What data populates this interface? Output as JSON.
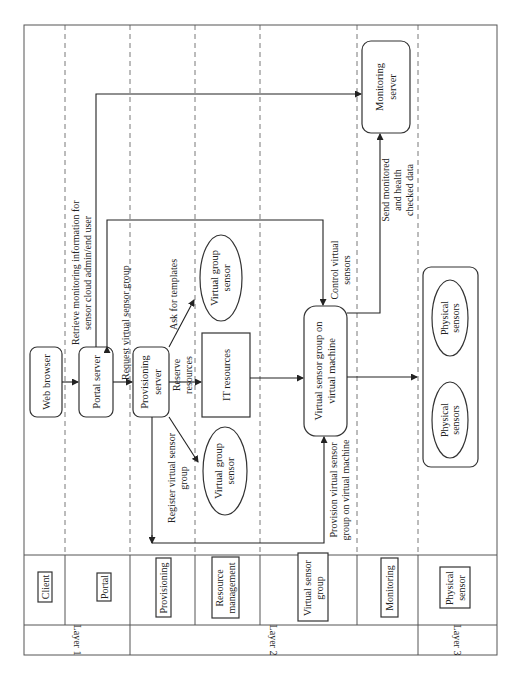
{
  "diagram": {
    "orientation": "rotated 90 degrees counter-clockwise",
    "layers": [
      {
        "id": "layer1",
        "label": "Layer 1"
      },
      {
        "id": "layer2",
        "label": "Layer 2"
      },
      {
        "id": "layer3",
        "label": "Layer 3"
      }
    ],
    "lanes": [
      {
        "id": "client",
        "label": "Client",
        "layer": "layer1"
      },
      {
        "id": "portal",
        "label": "Portal",
        "layer": "layer1"
      },
      {
        "id": "provisioning",
        "label": "Provisioning",
        "layer": "layer2"
      },
      {
        "id": "resource",
        "label_line1": "Resource",
        "label_line2": "management",
        "layer": "layer2"
      },
      {
        "id": "vsg",
        "label_line1": "Virtual sensor",
        "label_line2": "group",
        "layer": "layer2"
      },
      {
        "id": "monitoring",
        "label": "Monitoring",
        "layer": "layer2"
      },
      {
        "id": "physical",
        "label_line1": "Physical",
        "label_line2": "sensor",
        "layer": "layer3"
      }
    ],
    "nodes": {
      "web_browser": "Web browser",
      "portal_server": "Portal server",
      "provisioning_server": {
        "line1": "Provisioning",
        "line2": "server"
      },
      "vgs_top": {
        "line1": "Virtual group",
        "line2": "sensor"
      },
      "it_resources": "IT resources",
      "vgs_bottom": {
        "line1": "Virtual group",
        "line2": "sensor"
      },
      "vsg_vm": {
        "line1": "Virtual sensor group on",
        "line2": "virtual machine"
      },
      "monitoring_server": {
        "line1": "Monitoring",
        "line2": "server"
      },
      "physical_sensors_1": {
        "line1": "Physical",
        "line2": "sensors"
      },
      "physical_sensors_2": {
        "line1": "Physical",
        "line2": "sensors"
      }
    },
    "edges": {
      "retrieve": {
        "line1": "Retrieve monitoring information for",
        "line2": "sensor cloud admin/end user"
      },
      "request": "Request virtual sensor group",
      "ask_templates": "Ask for templates",
      "reserve": {
        "line1": "Reserve",
        "line2": "resources"
      },
      "register": {
        "line1": "Register virtual sensor",
        "line2": "group"
      },
      "provision": {
        "line1": "Provision virtual sensor",
        "line2": "group on virtual machine"
      },
      "control": {
        "line1": "Control virtual",
        "line2": "sensors"
      },
      "send_monitored": {
        "line1": "Send monitored",
        "line2": "and health",
        "line3": "checked data"
      }
    }
  }
}
